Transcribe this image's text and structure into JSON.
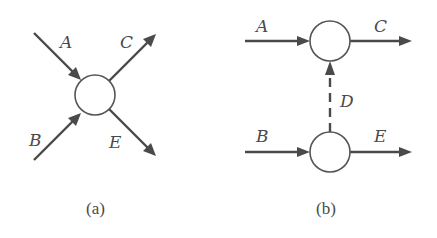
{
  "figure": {
    "panels": [
      {
        "id": "a",
        "caption": "(a)",
        "description": "Single node with two incoming flows (A, B) and two outgoing flows (C, E) arranged in an X pattern",
        "nodes": [
          {
            "id": "node",
            "cx": 95,
            "cy": 95,
            "r": 20
          }
        ],
        "edges": [
          {
            "label": "A",
            "direction": "incoming",
            "from": "top-left"
          },
          {
            "label": "B",
            "direction": "incoming",
            "from": "bottom-left"
          },
          {
            "label": "C",
            "direction": "outgoing",
            "to": "top-right"
          },
          {
            "label": "E",
            "direction": "outgoing",
            "to": "bottom-right"
          }
        ],
        "labels": {
          "A": "A",
          "B": "B",
          "C": "C",
          "E": "E"
        }
      },
      {
        "id": "b",
        "caption": "(b)",
        "description": "Two nodes stacked vertically; A enters top node and C exits; B enters bottom node and E exits; dashed arrow D goes from bottom node up to top node",
        "nodes": [
          {
            "id": "top-node",
            "cx": 330,
            "cy": 41,
            "r": 20
          },
          {
            "id": "bottom-node",
            "cx": 330,
            "cy": 152,
            "r": 20
          }
        ],
        "edges": [
          {
            "label": "A",
            "from": "left",
            "to": "top-node",
            "style": "solid"
          },
          {
            "label": "C",
            "from": "top-node",
            "to": "right",
            "style": "solid"
          },
          {
            "label": "B",
            "from": "left",
            "to": "bottom-node",
            "style": "solid"
          },
          {
            "label": "E",
            "from": "bottom-node",
            "to": "right",
            "style": "solid"
          },
          {
            "label": "D",
            "from": "bottom-node",
            "to": "top-node",
            "style": "dashed"
          }
        ],
        "labels": {
          "A": "A",
          "B": "B",
          "C": "C",
          "D": "D",
          "E": "E"
        }
      }
    ]
  }
}
